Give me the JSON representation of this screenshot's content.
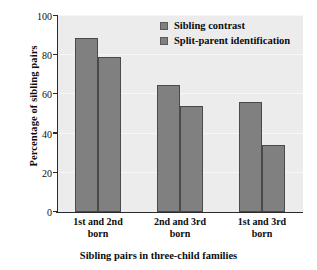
{
  "chart_data": {
    "type": "bar",
    "title": "",
    "xlabel": "Sibling pairs in three-child families",
    "ylabel": "Percentage of sibling pairs",
    "categories": [
      "1st and 2nd born",
      "2nd and 3rd born",
      "1st and 3rd born"
    ],
    "category_lines": [
      {
        "line1": "1st and 2nd",
        "line2": "born"
      },
      {
        "line1": "2nd and 3rd",
        "line2": "born"
      },
      {
        "line1": "1st and 3rd",
        "line2": "born"
      }
    ],
    "series": [
      {
        "name": "Sibling contrast",
        "values": [
          89,
          65,
          56
        ],
        "color": "#808080"
      },
      {
        "name": "Split-parent identification",
        "values": [
          79,
          54,
          34
        ],
        "color": "#808080"
      }
    ],
    "ylim": [
      0,
      100
    ],
    "yticks": [
      0,
      20,
      40,
      60,
      80,
      100
    ],
    "ytick_labels": [
      "0",
      "20",
      "40",
      "60",
      "80",
      "100"
    ],
    "grid": true,
    "legend_position": "top-right",
    "legend": [
      "Sibling contrast",
      "Split-parent identification"
    ],
    "plot_background": "#ececec",
    "axis_color": "#2b2b2b",
    "bar_edge_color": "#4a4a4a"
  }
}
